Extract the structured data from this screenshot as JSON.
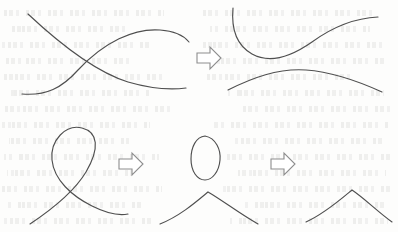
{
  "figure": {
    "background_color": "#fdfdfc",
    "stroke_color": "#4f4f4f",
    "arrow_fill_color": "#ffffff",
    "arrow_stroke_color": "#8d8d8d",
    "ghost_text_color": "#96968c",
    "width": 398,
    "height": 232,
    "rows": [
      {
        "name": "top-row",
        "description": "Two curves crossing at a single point are smoothed into two disjoint non-crossing curves.",
        "panels": [
          {
            "name": "crossing-curves-panel",
            "label": "crossing-curves",
            "curve_count": 2,
            "crossing_count": 1
          },
          {
            "name": "smoothed-curves-panel",
            "label": "smoothed-curves",
            "curve_count": 2,
            "crossing_count": 0
          }
        ],
        "arrows": [
          {
            "name": "transform-arrow-top",
            "direction": "right",
            "glyph": "block-arrow-right"
          }
        ]
      },
      {
        "name": "bottom-row",
        "description": "A self-crossing loop is resolved into a detached closed oval plus an arch, and the oval is then removed leaving only the arch.",
        "panels": [
          {
            "name": "self-crossing-loop-panel",
            "label": "self-crossing-loop",
            "curve_count": 1,
            "crossing_count": 1
          },
          {
            "name": "detached-oval-and-arch-panel",
            "label": "detached-oval-and-arch",
            "curve_count": 2,
            "crossing_count": 0
          },
          {
            "name": "arch-only-panel",
            "label": "arch-only",
            "curve_count": 1,
            "crossing_count": 0
          }
        ],
        "arrows": [
          {
            "name": "transform-arrow-bottom-left",
            "direction": "right",
            "glyph": "block-arrow-right"
          },
          {
            "name": "transform-arrow-bottom-right",
            "direction": "right",
            "glyph": "block-arrow-right"
          }
        ]
      }
    ]
  },
  "geometry": {
    "top_left_curve_a": "M 28,14 C 60,44 96,72 128,82 C 152,89 170,90 186,88",
    "top_left_curve_b": "M 22,94 C 46,96 62,88 78,70 C 104,42 134,28 160,30 C 176,31 184,36 189,42",
    "top_right_curve_upper": "M 233,8 C 231,30 238,46 252,54 C 270,64 292,56 312,42 C 334,26 356,18 378,17",
    "top_right_curve_lower": "M 228,90 C 252,78 278,68 306,70 C 334,72 360,82 382,92",
    "bottom_left_loop": "M 30,224 C 54,208 74,192 86,172 C 100,148 98,132 82,128 C 66,124 50,140 52,160 C 54,180 72,196 92,206 C 106,213 118,216 128,214",
    "bottom_mid_oval": "M 205,136 C 216,138 221,150 220,160 C 219,172 212,180 205,180 C 197,180 191,171 191,159 C 191,147 196,137 205,136 Z",
    "bottom_mid_arch": "M 160,224 C 180,216 196,202 208,192 C 222,200 240,214 258,224",
    "bottom_right_arch": "M 306,222 C 324,214 340,200 352,190 C 364,198 378,212 392,222",
    "arrow_top": {
      "x": 196,
      "y": 46,
      "w": 26,
      "h": 24
    },
    "arrow_bottom_left": {
      "x": 118,
      "y": 152,
      "w": 26,
      "h": 24
    },
    "arrow_bottom_right": {
      "x": 270,
      "y": 152,
      "w": 26,
      "h": 24
    }
  },
  "ghost_lines": [
    {
      "top": 10,
      "left": 4,
      "width": 160
    },
    {
      "top": 10,
      "left": 196,
      "width": 176
    },
    {
      "top": 26,
      "left": 8,
      "width": 120
    },
    {
      "top": 26,
      "left": 210,
      "width": 160
    },
    {
      "top": 42,
      "left": 2,
      "width": 150
    },
    {
      "top": 42,
      "left": 200,
      "width": 186
    },
    {
      "top": 58,
      "left": 6,
      "width": 130
    },
    {
      "top": 58,
      "left": 216,
      "width": 170
    },
    {
      "top": 74,
      "left": 3,
      "width": 165
    },
    {
      "top": 74,
      "left": 206,
      "width": 150
    },
    {
      "top": 90,
      "left": 10,
      "width": 140
    },
    {
      "top": 90,
      "left": 228,
      "width": 156
    },
    {
      "top": 106,
      "left": 5,
      "width": 172
    },
    {
      "top": 106,
      "left": 240,
      "width": 150
    },
    {
      "top": 122,
      "left": 2,
      "width": 148
    },
    {
      "top": 122,
      "left": 214,
      "width": 176
    },
    {
      "top": 138,
      "left": 9,
      "width": 120
    },
    {
      "top": 138,
      "left": 232,
      "width": 150
    },
    {
      "top": 154,
      "left": 4,
      "width": 155
    },
    {
      "top": 154,
      "left": 226,
      "width": 164
    },
    {
      "top": 170,
      "left": 7,
      "width": 126
    },
    {
      "top": 170,
      "left": 238,
      "width": 148
    },
    {
      "top": 186,
      "left": 2,
      "width": 160
    },
    {
      "top": 186,
      "left": 220,
      "width": 170
    },
    {
      "top": 202,
      "left": 8,
      "width": 136
    },
    {
      "top": 202,
      "left": 244,
      "width": 142
    },
    {
      "top": 218,
      "left": 4,
      "width": 150
    },
    {
      "top": 218,
      "left": 230,
      "width": 158
    }
  ]
}
